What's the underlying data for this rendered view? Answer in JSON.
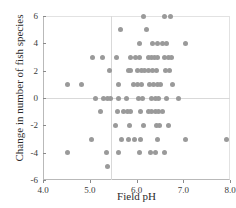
{
  "chart_data": {
    "type": "scatter",
    "title": "",
    "xlabel": "Field pH",
    "ylabel": "Change in number of fish species",
    "xlim": [
      4.0,
      8.0
    ],
    "ylim": [
      -6,
      6
    ],
    "xticks": [
      "4.0",
      "5.0",
      "6.0",
      "7.0",
      "8.0"
    ],
    "xtick_values": [
      4.0,
      5.0,
      6.0,
      7.0,
      8.0
    ],
    "yticks": [
      "6",
      "4",
      "2",
      "0",
      "-2",
      "-4",
      "-6"
    ],
    "ytick_values": [
      6,
      4,
      2,
      0,
      -2,
      -4,
      -6
    ],
    "grid": true,
    "gridlines_h": [
      0
    ],
    "gridlines_v": [
      5.45
    ],
    "legend": "none",
    "marker_color": "#9a9a9a",
    "marker_size": 5,
    "points": [
      [
        6.15,
        6
      ],
      [
        6.6,
        6
      ],
      [
        6.72,
        6
      ],
      [
        5.65,
        5
      ],
      [
        6.22,
        5
      ],
      [
        6.07,
        4
      ],
      [
        6.35,
        4
      ],
      [
        6.45,
        4
      ],
      [
        6.55,
        4
      ],
      [
        6.65,
        4
      ],
      [
        7.05,
        4
      ],
      [
        5.05,
        3
      ],
      [
        5.28,
        3
      ],
      [
        5.57,
        3
      ],
      [
        5.88,
        3
      ],
      [
        5.97,
        3
      ],
      [
        6.06,
        3
      ],
      [
        6.25,
        3
      ],
      [
        6.32,
        3
      ],
      [
        6.38,
        3
      ],
      [
        6.45,
        3
      ],
      [
        6.6,
        3
      ],
      [
        6.68,
        3
      ],
      [
        6.75,
        3
      ],
      [
        5.42,
        2
      ],
      [
        5.82,
        2
      ],
      [
        5.88,
        2
      ],
      [
        6.02,
        2
      ],
      [
        6.1,
        2
      ],
      [
        6.18,
        2
      ],
      [
        6.26,
        2
      ],
      [
        6.34,
        2
      ],
      [
        6.42,
        2
      ],
      [
        6.62,
        2
      ],
      [
        6.7,
        2
      ],
      [
        4.52,
        1
      ],
      [
        4.83,
        1
      ],
      [
        5.62,
        1
      ],
      [
        5.93,
        1
      ],
      [
        6.02,
        1
      ],
      [
        6.1,
        1
      ],
      [
        6.28,
        1
      ],
      [
        6.36,
        1
      ],
      [
        6.44,
        1
      ],
      [
        6.52,
        1
      ],
      [
        6.78,
        1
      ],
      [
        5.12,
        0
      ],
      [
        5.3,
        0
      ],
      [
        5.38,
        0
      ],
      [
        5.45,
        0
      ],
      [
        5.62,
        0
      ],
      [
        5.78,
        0
      ],
      [
        6.05,
        0
      ],
      [
        6.13,
        0
      ],
      [
        6.33,
        0
      ],
      [
        6.4,
        0
      ],
      [
        6.47,
        0
      ],
      [
        6.65,
        0
      ],
      [
        6.9,
        0
      ],
      [
        5.22,
        -1
      ],
      [
        5.6,
        -1
      ],
      [
        5.72,
        -1
      ],
      [
        5.8,
        -1
      ],
      [
        5.88,
        -1
      ],
      [
        6.08,
        -1
      ],
      [
        6.25,
        -1
      ],
      [
        6.33,
        -1
      ],
      [
        6.4,
        -1
      ],
      [
        6.47,
        -1
      ],
      [
        6.55,
        -1
      ],
      [
        5.55,
        -2
      ],
      [
        5.85,
        -2
      ],
      [
        6.15,
        -2
      ],
      [
        6.42,
        -2
      ],
      [
        6.5,
        -2
      ],
      [
        6.68,
        -2
      ],
      [
        5.03,
        -3
      ],
      [
        5.68,
        -3
      ],
      [
        5.82,
        -3
      ],
      [
        5.95,
        -3
      ],
      [
        6.08,
        -3
      ],
      [
        6.45,
        -3
      ],
      [
        7.05,
        -3
      ],
      [
        7.92,
        -3
      ],
      [
        4.53,
        -4
      ],
      [
        5.35,
        -4
      ],
      [
        5.62,
        -4
      ],
      [
        6.07,
        -4
      ],
      [
        6.3,
        -4
      ],
      [
        6.4,
        -4
      ],
      [
        6.6,
        -4
      ],
      [
        5.37,
        -5
      ]
    ]
  }
}
